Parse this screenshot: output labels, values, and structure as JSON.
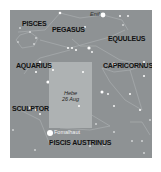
{
  "map": {
    "background": "#8e9294",
    "highlight_color": "#aeb2b3",
    "constellations": [
      {
        "name": "PISCES",
        "x": 12,
        "y": 10
      },
      {
        "name": "PEGASUS",
        "x": 42,
        "y": 16
      },
      {
        "name": "EQUULEUS",
        "x": 98,
        "y": 25
      },
      {
        "name": "AQUARIUS",
        "x": 6,
        "y": 52
      },
      {
        "name": "CAPRICORNUS",
        "x": 93,
        "y": 52
      },
      {
        "name": "SCULPTOR",
        "x": 2,
        "y": 95
      },
      {
        "name": "PISCIS AUSTRINUS",
        "x": 39,
        "y": 129
      }
    ],
    "star_labels": [
      {
        "name": "Enif",
        "x": 80,
        "y": 2
      },
      {
        "name": "Fomalhaut",
        "x": 44,
        "y": 110
      }
    ],
    "highlight": {
      "line1": "Hebe",
      "line2": "26 Aug"
    }
  }
}
